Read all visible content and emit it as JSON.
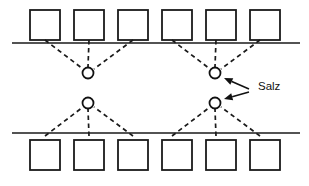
{
  "figure": {
    "title": "Salz",
    "background_color": "#ffffff",
    "line_color": "#1a1a1a",
    "fill_color": "#ffffff"
  },
  "labels": [
    {
      "id": "salz-label",
      "text": "Salz",
      "x": 258,
      "y": 87
    }
  ],
  "chart_data": {
    "type": "diagram",
    "title": "Salz",
    "canvas": {
      "width": 309,
      "height": 186
    },
    "interface_lines": [
      {
        "id": "upper-interface-line",
        "x1": 12,
        "y1": 43,
        "x2": 300,
        "y2": 43
      },
      {
        "id": "lower-interface-line",
        "x1": 12,
        "y1": 133,
        "x2": 300,
        "y2": 133
      }
    ],
    "squares": {
      "size": 30,
      "upper_row": {
        "id": "upper-square-row",
        "y": 10,
        "x_positions": [
          30,
          74,
          118,
          162,
          206,
          250
        ]
      },
      "lower_row": {
        "id": "lower-square-row",
        "y": 140,
        "x_positions": [
          30,
          74,
          118,
          162,
          206,
          250
        ]
      }
    },
    "ions": [
      {
        "id": "ion-upper-left",
        "cx": 88,
        "cy": 73,
        "r": 5.5,
        "label": "Salz"
      },
      {
        "id": "ion-upper-right",
        "cx": 215,
        "cy": 73,
        "r": 5.5,
        "label": "Salz"
      },
      {
        "id": "ion-lower-left",
        "cx": 88,
        "cy": 103,
        "r": 5.5,
        "label": "Salz"
      },
      {
        "id": "ion-lower-right",
        "cx": 215,
        "cy": 103,
        "r": 5.5,
        "label": "Salz"
      }
    ],
    "bonds": [
      {
        "from_square": 0,
        "row": "upper",
        "x1": 45,
        "y1": 40,
        "x2": 83,
        "y2": 69
      },
      {
        "from_square": 1,
        "row": "upper",
        "x1": 89,
        "y1": 40,
        "x2": 88,
        "y2": 67
      },
      {
        "from_square": 2,
        "row": "upper",
        "x1": 133,
        "y1": 40,
        "x2": 94,
        "y2": 69
      },
      {
        "from_square": 3,
        "row": "upper",
        "x1": 172,
        "y1": 40,
        "x2": 210,
        "y2": 69
      },
      {
        "from_square": 4,
        "row": "upper",
        "x1": 216,
        "y1": 40,
        "x2": 215,
        "y2": 67
      },
      {
        "from_square": 5,
        "row": "upper",
        "x1": 260,
        "y1": 40,
        "x2": 221,
        "y2": 69
      },
      {
        "from_square": 0,
        "row": "lower",
        "x1": 45,
        "y1": 136,
        "x2": 83,
        "y2": 107
      },
      {
        "from_square": 1,
        "row": "lower",
        "x1": 89,
        "y1": 136,
        "x2": 88,
        "y2": 109
      },
      {
        "from_square": 2,
        "row": "lower",
        "x1": 133,
        "y1": 136,
        "x2": 94,
        "y2": 107
      },
      {
        "from_square": 3,
        "row": "lower",
        "x1": 172,
        "y1": 136,
        "x2": 210,
        "y2": 107
      },
      {
        "from_square": 4,
        "row": "lower",
        "x1": 216,
        "y1": 136,
        "x2": 215,
        "y2": 109
      },
      {
        "from_square": 5,
        "row": "lower",
        "x1": 260,
        "y1": 136,
        "x2": 221,
        "y2": 107
      }
    ],
    "arrows": [
      {
        "id": "arrow-to-upper-ion",
        "target": "ion-upper-right",
        "tail_x": 249,
        "tail_y": 89,
        "tip_x": 224,
        "tip_y": 78,
        "direction": "up-left"
      },
      {
        "id": "arrow-to-lower-ion",
        "target": "ion-lower-right",
        "tail_x": 249,
        "tail_y": 92,
        "tip_x": 224,
        "tip_y": 99,
        "direction": "down-left"
      }
    ]
  }
}
